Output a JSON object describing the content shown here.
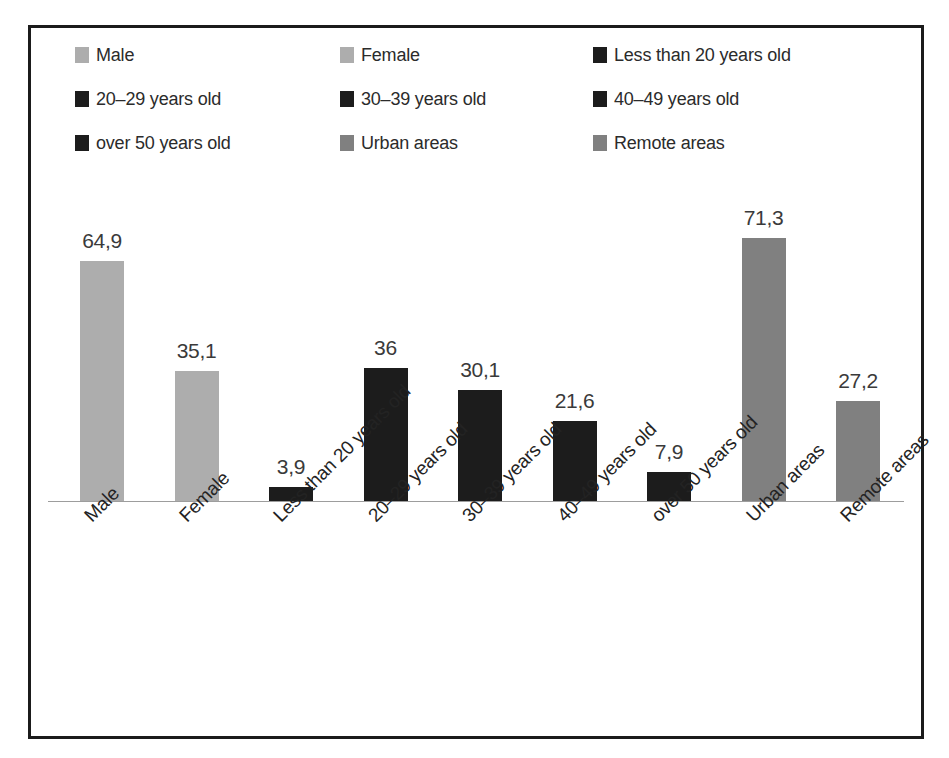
{
  "chart_data": {
    "type": "bar",
    "title": "",
    "subtitle": "",
    "xlabel": "",
    "ylabel": "",
    "categories": [
      "Male",
      "Female",
      "Less than 20 years old",
      "20–29 years old",
      "30–39 years old",
      "40–49 years old",
      "over 50 years old",
      "Urban areas",
      "Remote areas"
    ],
    "values": [
      64.9,
      35.1,
      3.9,
      36,
      30.1,
      21.6,
      7.9,
      71.3,
      27.2
    ],
    "value_labels": [
      "64,9",
      "35,1",
      "3,9",
      "36",
      "30,1",
      "21,6",
      "7,9",
      "71,3",
      "27,2"
    ],
    "bar_colors": [
      "#adadad",
      "#adadad",
      "#1c1c1c",
      "#1c1c1c",
      "#1c1c1c",
      "#1c1c1c",
      "#1c1c1c",
      "#808080",
      "#808080"
    ],
    "ylim": [
      0,
      78
    ],
    "grid": false,
    "legend_position": "top",
    "axis_line_color": "#9d9d9d",
    "frame_color": "#1b1b1b",
    "decimal_separator": ","
  },
  "legend": {
    "items": [
      {
        "label": "Male",
        "color": "#adadad"
      },
      {
        "label": "Female",
        "color": "#adadad"
      },
      {
        "label": "Less than 20 years old",
        "color": "#1c1c1c"
      },
      {
        "label": "20–29 years old",
        "color": "#1c1c1c"
      },
      {
        "label": "30–39 years old",
        "color": "#1c1c1c"
      },
      {
        "label": "40–49 years old",
        "color": "#1c1c1c"
      },
      {
        "label": "over 50 years old",
        "color": "#1c1c1c"
      },
      {
        "label": "Urban areas",
        "color": "#808080"
      },
      {
        "label": "Remote areas",
        "color": "#808080"
      }
    ]
  }
}
